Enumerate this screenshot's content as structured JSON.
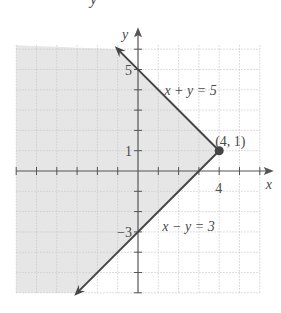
{
  "header_fragment": "y",
  "chart_data": {
    "type": "line",
    "title": "",
    "xlabel": "x",
    "ylabel": "y",
    "xlim": [
      -6,
      6
    ],
    "ylim": [
      -6,
      6.2
    ],
    "grid": true,
    "grid_step": 1,
    "x_tick_labels": [
      {
        "value": 4,
        "label": "4"
      }
    ],
    "y_tick_labels": [
      {
        "value": 5,
        "label": "5"
      },
      {
        "value": 1,
        "label": "1"
      },
      {
        "value": -3,
        "label": "−3"
      }
    ],
    "series": [
      {
        "name": "x + y = 5",
        "equation": "x + y = 5",
        "points": [
          [
            4,
            1
          ],
          [
            -1,
            6
          ]
        ],
        "arrow_end": true
      },
      {
        "name": "x − y = 3",
        "equation": "x − y = 3",
        "points": [
          [
            4,
            1
          ],
          [
            -3,
            -6
          ]
        ],
        "arrow_end": true
      }
    ],
    "shaded_region": {
      "description": "x + y ≤ 5 and x − y ≤ 3",
      "vertices": [
        [
          4,
          1
        ],
        [
          -1,
          6
        ],
        [
          -6,
          6.2
        ],
        [
          -6,
          -6
        ],
        [
          -3,
          -6
        ]
      ]
    },
    "annotations": [
      {
        "text": "x + y = 5",
        "at": [
          1.3,
          4
        ]
      },
      {
        "text": "x − y = 3",
        "at": [
          1.2,
          -2.7
        ]
      },
      {
        "text": "(4, 1)",
        "at": [
          3.8,
          1.5
        ]
      }
    ],
    "points": [
      {
        "x": 4,
        "y": 1,
        "label": "(4, 1)"
      }
    ],
    "colors": {
      "line": "#454545",
      "shade": "#e6e6e6",
      "grid": "#c8c8c8",
      "axis": "#555555"
    }
  }
}
